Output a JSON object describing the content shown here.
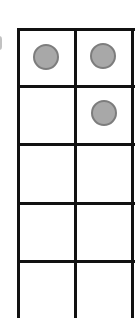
{
  "frame": {
    "columns": 2,
    "visible_rows": 5,
    "cells": [
      {
        "row": 0,
        "col": 0,
        "filled": true
      },
      {
        "row": 0,
        "col": 1,
        "filled": true
      },
      {
        "row": 1,
        "col": 0,
        "filled": false
      },
      {
        "row": 1,
        "col": 1,
        "filled": true
      },
      {
        "row": 2,
        "col": 0,
        "filled": false
      },
      {
        "row": 2,
        "col": 1,
        "filled": false
      },
      {
        "row": 3,
        "col": 0,
        "filled": false
      },
      {
        "row": 3,
        "col": 1,
        "filled": false
      },
      {
        "row": 4,
        "col": 0,
        "filled": false
      },
      {
        "row": 4,
        "col": 1,
        "filled": false
      }
    ],
    "counter_count": 3,
    "counter_color": "#a8a8a8",
    "line_color": "#111111"
  }
}
